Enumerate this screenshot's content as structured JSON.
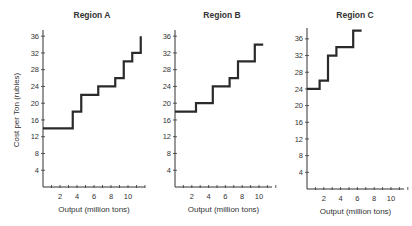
{
  "chart_data": [
    {
      "type": "line",
      "style": "step",
      "title": "Region A",
      "xlabel": "Output (million tons)",
      "ylabel": "Cost per Ton (rubles)",
      "xticks": [
        2,
        4,
        6,
        8,
        10
      ],
      "yticks": [
        4,
        8,
        12,
        16,
        20,
        24,
        28,
        32,
        36
      ],
      "xlim": [
        0,
        12
      ],
      "ylim": [
        0,
        38
      ],
      "grid": false,
      "steps": [
        {
          "x_start": 0,
          "x_end": 3.5,
          "cost": 14
        },
        {
          "x_start": 3.5,
          "x_end": 4.5,
          "cost": 18
        },
        {
          "x_start": 4.5,
          "x_end": 6.5,
          "cost": 22
        },
        {
          "x_start": 6.5,
          "x_end": 8.5,
          "cost": 24
        },
        {
          "x_start": 8.5,
          "x_end": 9.5,
          "cost": 26
        },
        {
          "x_start": 9.5,
          "x_end": 10.5,
          "cost": 30
        },
        {
          "x_start": 10.5,
          "x_end": 11.5,
          "cost": 32
        },
        {
          "x_start": 11.5,
          "x_end": 11.5,
          "cost": 36
        }
      ]
    },
    {
      "type": "line",
      "style": "step",
      "title": "Region B",
      "xlabel": "Output (million tons)",
      "ylabel": "",
      "xticks": [
        2,
        4,
        6,
        8,
        10
      ],
      "yticks": [
        4,
        8,
        12,
        16,
        20,
        24,
        28,
        32,
        36
      ],
      "xlim": [
        0,
        12
      ],
      "ylim": [
        0,
        38
      ],
      "grid": false,
      "steps": [
        {
          "x_start": 0,
          "x_end": 2.5,
          "cost": 18
        },
        {
          "x_start": 2.5,
          "x_end": 4.5,
          "cost": 20
        },
        {
          "x_start": 4.5,
          "x_end": 6.5,
          "cost": 24
        },
        {
          "x_start": 6.5,
          "x_end": 7.5,
          "cost": 26
        },
        {
          "x_start": 7.5,
          "x_end": 9.5,
          "cost": 30
        },
        {
          "x_start": 9.5,
          "x_end": 10.5,
          "cost": 34
        }
      ]
    },
    {
      "type": "line",
      "style": "step",
      "title": "Region C",
      "xlabel": "Output (million tons)",
      "ylabel": "",
      "xticks": [
        2,
        4,
        6,
        8,
        10
      ],
      "yticks": [
        4,
        8,
        12,
        16,
        20,
        24,
        28,
        32,
        36
      ],
      "xlim": [
        0,
        12
      ],
      "ylim": [
        0,
        40
      ],
      "grid": false,
      "steps": [
        {
          "x_start": 0,
          "x_end": 1.5,
          "cost": 24
        },
        {
          "x_start": 1.5,
          "x_end": 2.5,
          "cost": 26
        },
        {
          "x_start": 2.5,
          "x_end": 3.5,
          "cost": 32
        },
        {
          "x_start": 3.5,
          "x_end": 5.5,
          "cost": 34
        },
        {
          "x_start": 5.5,
          "x_end": 6.5,
          "cost": 38
        }
      ]
    }
  ]
}
